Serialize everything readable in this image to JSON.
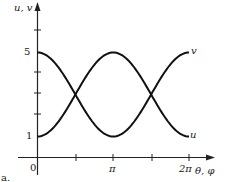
{
  "chart_data": {
    "type": "line",
    "title": "",
    "panel_label": "a.",
    "xlabel": "θ, φ",
    "ylabel": "u, v",
    "x_ticks": [
      "0",
      "",
      "π",
      "",
      "2π"
    ],
    "x_tick_values": [
      0,
      1.5708,
      3.1416,
      4.7124,
      6.2832
    ],
    "y_ticks": [
      "1",
      "",
      "",
      "",
      "5",
      ""
    ],
    "y_tick_values": [
      1,
      2,
      3,
      4,
      5,
      6
    ],
    "xlim": [
      0,
      6.2832
    ],
    "ylim": [
      0,
      6.5
    ],
    "grid": false,
    "series": [
      {
        "name": "u",
        "formula": "3 + 2cos(θ)",
        "x": [
          0,
          0.785,
          1.571,
          2.356,
          3.142,
          3.927,
          4.712,
          5.498,
          6.283
        ],
        "values": [
          5,
          4.41,
          3,
          1.59,
          1,
          1.59,
          3,
          4.41,
          5
        ]
      },
      {
        "name": "v",
        "formula": "3 - 2cos(θ)",
        "x": [
          0,
          0.785,
          1.571,
          2.356,
          3.142,
          3.927,
          4.712,
          5.498,
          6.283
        ],
        "values": [
          1,
          1.59,
          3,
          4.41,
          5,
          4.41,
          3,
          1.59,
          1
        ]
      }
    ]
  },
  "labels": {
    "ylabel": "u, v",
    "xlabel": "θ, φ",
    "y5": "5",
    "y1": "1",
    "x0": "0",
    "xpi": "π",
    "x2pi": "2π",
    "curve_u": "u",
    "curve_v": "v",
    "panel": "a."
  }
}
